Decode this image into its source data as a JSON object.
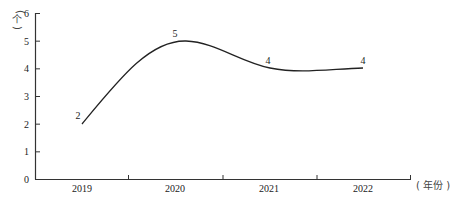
{
  "chart_data": {
    "type": "line",
    "title": "",
    "xlabel": "（年份）",
    "ylabel": "（个）",
    "categories": [
      "2019",
      "2020",
      "2021",
      "2022"
    ],
    "series": [
      {
        "name": "count",
        "values": [
          2,
          5,
          4,
          4
        ],
        "smooth": true,
        "color": "#222222"
      }
    ],
    "data_labels": [
      "2",
      "5",
      "4",
      "4"
    ],
    "y_ticks": [
      "0",
      "1",
      "2",
      "3",
      "4",
      "5",
      "6"
    ],
    "ylim": [
      0,
      6
    ],
    "grid": false,
    "legend": "none"
  }
}
